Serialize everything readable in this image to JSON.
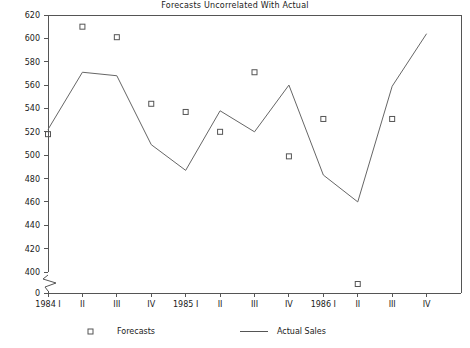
{
  "chart_data": {
    "type": "line",
    "title": "Forecasts Uncorrelated With Actual",
    "xlabel": "",
    "ylabel": "",
    "categories": [
      "1984 I",
      "II",
      "III",
      "IV",
      "1985 I",
      "II",
      "III",
      "IV",
      "1986 I",
      "II",
      "III",
      "IV"
    ],
    "x_tick_labels": [
      "1984 I",
      "II",
      "III",
      "IV",
      "1985 I",
      "II",
      "III",
      "IV",
      "1986 I",
      "II",
      "III",
      "IV"
    ],
    "y_tick_labels": [
      "620",
      "600",
      "580",
      "560",
      "540",
      "520",
      "500",
      "480",
      "460",
      "440",
      "420",
      "400",
      "0"
    ],
    "y_tick_values": [
      620,
      600,
      580,
      560,
      540,
      520,
      500,
      480,
      460,
      440,
      420,
      400,
      0
    ],
    "ylim": [
      390,
      620
    ],
    "axis_break": true,
    "grid": false,
    "legend_position": "bottom",
    "series": [
      {
        "name": "Forecasts",
        "marker": "open-square",
        "style": "markers",
        "values": [
          518,
          610,
          601,
          544,
          537,
          520,
          571,
          499,
          531,
          391,
          531,
          null
        ],
        "points": [
          {
            "x": "1984 I",
            "y": null
          },
          {
            "x": "II",
            "y": 518
          },
          {
            "x": "III",
            "y": 610
          },
          {
            "x": "IV",
            "y": 601
          },
          {
            "x": "1985 I",
            "y": 544
          },
          {
            "x": "II",
            "y": 537
          },
          {
            "x": "III",
            "y": 520
          },
          {
            "x": "IV",
            "y": 571
          },
          {
            "x": "1986 I",
            "y": 499
          },
          {
            "x": "II",
            "y": 531
          },
          {
            "x": "III",
            "y": 391
          },
          {
            "x": "IV",
            "y": 531
          }
        ]
      },
      {
        "name": "Actual Sales",
        "marker": "none",
        "style": "line",
        "values": [
          522,
          571,
          568,
          509,
          487,
          538,
          520,
          560,
          483,
          460,
          559,
          604
        ],
        "points": [
          {
            "x": "1984 I",
            "y": 522
          },
          {
            "x": "II",
            "y": 571
          },
          {
            "x": "III",
            "y": 568
          },
          {
            "x": "IV",
            "y": 509
          },
          {
            "x": "1985 I",
            "y": 487
          },
          {
            "x": "II",
            "y": 538
          },
          {
            "x": "III",
            "y": 520
          },
          {
            "x": "IV",
            "y": 560
          },
          {
            "x": "1986 I",
            "y": 483
          },
          {
            "x": "II",
            "y": 460
          },
          {
            "x": "III",
            "y": 559
          },
          {
            "x": "IV",
            "y": 604
          }
        ]
      }
    ],
    "legend": [
      {
        "label": "Forecasts",
        "marker": "open-square"
      },
      {
        "label": "Actual Sales",
        "marker": "line"
      }
    ],
    "colors": {
      "axis": "#555555",
      "line": "#666666",
      "marker": "#555555",
      "text": "#1a1a1a",
      "background": "#ffffff"
    }
  }
}
